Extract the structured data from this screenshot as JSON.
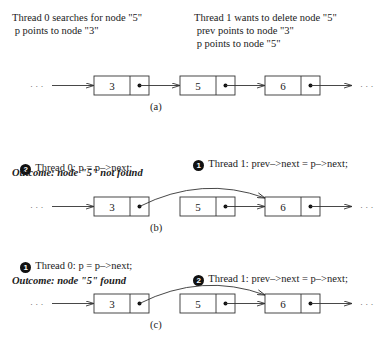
{
  "panel_a": {
    "thread0_line1": "Thread 0 searches for node \"5\"",
    "thread0_line2": " p points to node \"3\"",
    "thread1_line1": "Thread 1 wants to delete node \"5\"",
    "thread1_line2": " prev points to node \"3\"",
    "thread1_line3": " p points to node \"5\"",
    "caption": "(a)"
  },
  "panel_b": {
    "thread0_step": "2",
    "thread0_text": "Thread 0: p = p–>next;",
    "thread1_step": "1",
    "thread1_text": "Thread 1: prev–>next = p–>next;",
    "outcome": "Outcome: node \"5\" not found",
    "caption": "(b)"
  },
  "panel_c": {
    "thread0_step": "1",
    "thread0_text": "Thread 0: p = p–>next;",
    "thread1_step": "2",
    "thread1_text": "Thread 1: prev–>next = p–>next;",
    "outcome": "Outcome: node \"5\" found",
    "caption": "(c)"
  },
  "nodes": [
    {
      "value": "3"
    },
    {
      "value": "5"
    },
    {
      "value": "6"
    }
  ],
  "ellipsis": "· · ·",
  "colors": {
    "line": "#333333",
    "badge": "#111111"
  }
}
